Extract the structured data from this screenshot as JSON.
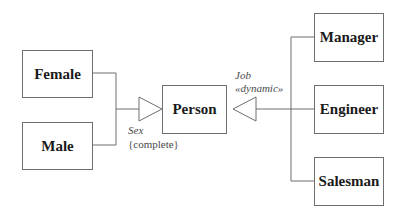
{
  "diagram": {
    "type": "UML class generalization",
    "superclass": {
      "name": "Person"
    },
    "generalization_sets": [
      {
        "name": "Sex",
        "constraint": "{complete}",
        "subclasses": [
          {
            "name": "Female"
          },
          {
            "name": "Male"
          }
        ]
      },
      {
        "name": "Job",
        "stereotype": "«dynamic»",
        "subclasses": [
          {
            "name": "Manager"
          },
          {
            "name": "Engineer"
          },
          {
            "name": "Salesman"
          }
        ]
      }
    ],
    "colors": {
      "line": "#6e6e6e",
      "text": "#1a1a1a",
      "annotation": "#4a4a4a",
      "background": "#ffffff"
    }
  }
}
